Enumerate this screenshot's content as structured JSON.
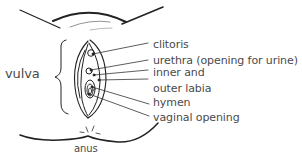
{
  "diagram": {
    "type": "anatomical-labeled-illustration",
    "group_label": "vulva",
    "bottom_label": "anus",
    "labels": [
      {
        "text": "clitoris"
      },
      {
        "text": "urethra (opening for urine)"
      },
      {
        "text": "inner and"
      },
      {
        "text": "outer labia"
      },
      {
        "text": "hymen"
      },
      {
        "text": "vaginal opening"
      }
    ],
    "colors": {
      "line": "#222222",
      "text": "#4a4a4a",
      "background": "#ffffff"
    }
  }
}
